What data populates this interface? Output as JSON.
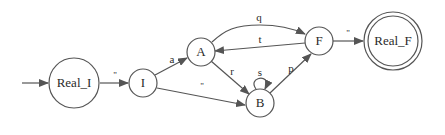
{
  "diagram": {
    "type": "state-machine",
    "colors": {
      "stroke": "#555555",
      "text": "#2a2a2a",
      "background": "#ffffff"
    },
    "nodes": [
      {
        "id": "Real_I",
        "label": "Real_I",
        "accepting": false,
        "initial": true
      },
      {
        "id": "I",
        "label": "I",
        "accepting": false
      },
      {
        "id": "A",
        "label": "A",
        "accepting": false
      },
      {
        "id": "B",
        "label": "B",
        "accepting": false
      },
      {
        "id": "F",
        "label": "F",
        "accepting": false
      },
      {
        "id": "Real_F",
        "label": "Real_F",
        "accepting": true
      }
    ],
    "edges": [
      {
        "from": "Real_I",
        "to": "I",
        "label": "\""
      },
      {
        "from": "I",
        "to": "A",
        "label": "a"
      },
      {
        "from": "I",
        "to": "B",
        "label": "\""
      },
      {
        "from": "A",
        "to": "F",
        "label": "q"
      },
      {
        "from": "F",
        "to": "A",
        "label": "t"
      },
      {
        "from": "A",
        "to": "B",
        "label": "r"
      },
      {
        "from": "B",
        "to": "B",
        "label": "s"
      },
      {
        "from": "B",
        "to": "F",
        "label": "p"
      },
      {
        "from": "F",
        "to": "Real_F",
        "label": "\""
      }
    ]
  }
}
